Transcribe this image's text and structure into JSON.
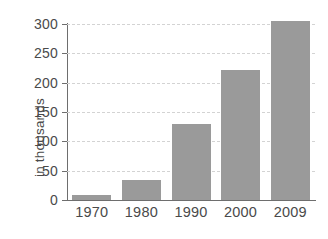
{
  "chart_data": {
    "type": "bar",
    "title": "",
    "subtitle": "",
    "xlabel": "",
    "ylabel": "in thousands",
    "categories": [
      "1970",
      "1980",
      "1990",
      "2000",
      "2009"
    ],
    "values": [
      8,
      34,
      129,
      222,
      305
    ],
    "series": [
      {
        "name": "",
        "values": [
          8,
          34,
          129,
          222,
          305
        ]
      }
    ],
    "ylim": [
      0,
      300
    ],
    "ytick_labels": [
      "0",
      "50",
      "100",
      "150",
      "200",
      "250",
      "300"
    ],
    "ytick_values": [
      0,
      50,
      100,
      150,
      200,
      250,
      300
    ],
    "grid": "horizontal-dashed",
    "legend": "none",
    "bar_color": "#9a9a9a",
    "axis_color": "#6e6e6e",
    "grid_color": "#d3d3d3",
    "text_color": "#4a4a4a",
    "background_color": "#ffffff"
  }
}
